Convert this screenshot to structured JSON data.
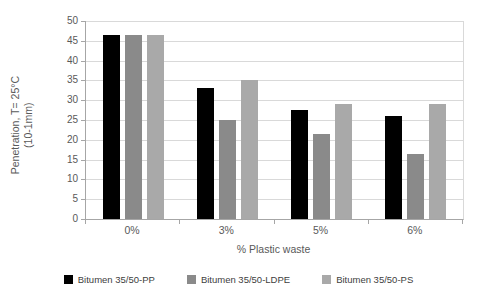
{
  "chart_data": {
    "type": "bar",
    "title": "",
    "categories": [
      "0%",
      "3%",
      "5%",
      "6%"
    ],
    "series": [
      {
        "name": "Bitumen 35/50-PP",
        "color": "#000000",
        "values": [
          46.5,
          33.0,
          27.5,
          26.0
        ]
      },
      {
        "name": "Bitumen 35/50-LDPE",
        "color": "#8a8a8a",
        "values": [
          46.5,
          25.0,
          21.5,
          16.5
        ]
      },
      {
        "name": "Bitumen 35/50-PS",
        "color": "#a9a9a9",
        "values": [
          46.5,
          35.0,
          29.0,
          29.0
        ]
      }
    ],
    "xlabel": "% Plastic waste",
    "ylabel_lines": [
      "Penetration, T= 25°C",
      "(10-1mm)"
    ],
    "ylim": [
      0,
      50
    ],
    "yticks": [
      0,
      5,
      10,
      15,
      20,
      25,
      30,
      35,
      40,
      45,
      50
    ],
    "grid": "horizontal",
    "legend_position": "bottom"
  },
  "style": {
    "background": "#ffffff",
    "text_color": "#595959",
    "grid_color": "#d9d9d9",
    "axis_color": "#a6a6a6"
  }
}
